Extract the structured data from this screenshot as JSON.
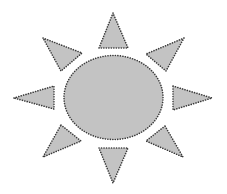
{
  "title": "Sun",
  "colors": {
    "fill": "#c3c3c3",
    "stroke": "#3a3a3a",
    "background": "#ffffff"
  },
  "sun": {
    "body": {
      "shape": "ellipse",
      "cx": 113.5,
      "cy": 97.5,
      "rx": 49.5,
      "ry": 42
    },
    "rays": [
      {
        "name": "ray-top",
        "points": "113,13 99,48 128,48"
      },
      {
        "name": "ray-top-right",
        "points": "184,38 146,54 166,71"
      },
      {
        "name": "ray-right",
        "points": "173,86 212,98 173,110"
      },
      {
        "name": "ray-bottom-right",
        "points": "165,126 146,141 183,157"
      },
      {
        "name": "ray-bottom",
        "points": "99,148 128,148 113,183"
      },
      {
        "name": "ray-bottom-left",
        "points": "61,125 81,141 43,157"
      },
      {
        "name": "ray-left",
        "points": "14,98 54,86 54,109"
      },
      {
        "name": "ray-top-left",
        "points": "43,38 82,53 61,71"
      }
    ]
  }
}
